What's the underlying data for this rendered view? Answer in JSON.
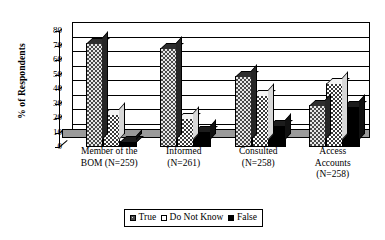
{
  "chart_data": {
    "type": "bar",
    "title": "",
    "xlabel": "",
    "ylabel": "% of Respondents",
    "ylim": [
      0,
      80
    ],
    "yticks": [
      0,
      10,
      20,
      30,
      40,
      50,
      60,
      70,
      80
    ],
    "ytick_labels": [
      "0",
      "10",
      "20",
      "30",
      "40",
      "50",
      "60",
      "70",
      "80"
    ],
    "grid": true,
    "legend_position": "bottom",
    "style": "3d-clustered-column",
    "categories": [
      "Member of the BOM (N=259)",
      "Informed (N=261)",
      "Consulted (N=258)",
      "Access Accounts (N=258)"
    ],
    "category_lines": [
      [
        "Member of the",
        "BOM (N=259)"
      ],
      [
        "Informed",
        "(N=261)"
      ],
      [
        "Consulted",
        "(N=258)"
      ],
      [
        "Access",
        "Accounts",
        "(N=258)"
      ]
    ],
    "series": [
      {
        "name": "True",
        "values": [
          72,
          68,
          49,
          29
        ],
        "color": "#4a4a4a",
        "pattern": "dark-gray-with-light-dots"
      },
      {
        "name": "Do Not Know",
        "values": [
          23,
          20,
          36,
          44
        ],
        "color": "#ffffff",
        "pattern": "white-with-dark-dots"
      },
      {
        "name": "False",
        "values": [
          4,
          11,
          15,
          28
        ],
        "color": "#000000",
        "pattern": "solid-black"
      }
    ]
  },
  "legend": {
    "items": [
      {
        "label": "True"
      },
      {
        "label": "Do Not Know"
      },
      {
        "label": "False"
      }
    ]
  }
}
